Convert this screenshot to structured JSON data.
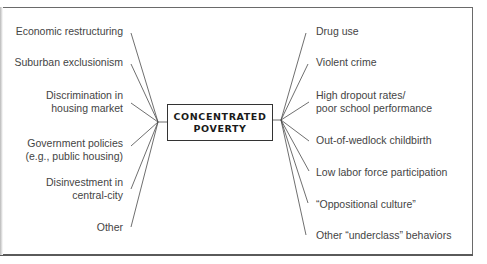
{
  "diagram": {
    "center": {
      "label": "CONCENTRATED\nPOVERTY"
    },
    "causes": [
      {
        "label": "Economic restructuring"
      },
      {
        "label": "Suburban exclusionism"
      },
      {
        "label": "Discrimination in\nhousing market"
      },
      {
        "label": "Government policies\n(e.g., public housing)"
      },
      {
        "label": "Disinvestment in\ncentral-city"
      },
      {
        "label": "Other"
      }
    ],
    "effects": [
      {
        "label": "Drug use"
      },
      {
        "label": "Violent crime"
      },
      {
        "label": "High dropout rates/\npoor school performance"
      },
      {
        "label": "Out-of-wedlock childbirth"
      },
      {
        "label": "Low labor force participation"
      },
      {
        "label": "“Oppositional culture”"
      },
      {
        "label": "Other “underclass” behaviors"
      }
    ],
    "colors": {
      "line": "#444444",
      "text": "#444444",
      "frame": "#6a6a6a"
    }
  }
}
